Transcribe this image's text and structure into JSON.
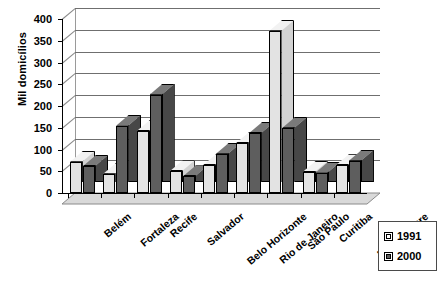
{
  "chart_data": {
    "type": "bar",
    "title": "",
    "xlabel": "",
    "ylabel": "Mil domicílios",
    "ylim": [
      0,
      400
    ],
    "ytick_step": 50,
    "yticks": [
      "400",
      "350",
      "300",
      "250",
      "200",
      "150",
      "100",
      "50",
      "0"
    ],
    "grid": true,
    "legend_position": "bottom-right",
    "style": "3d-clustered-column",
    "categories": [
      "Belém",
      "Fortaleza",
      "Recife",
      "Salvador",
      "Belo Horizonte",
      "Rio de Janeiro",
      "São Paulo",
      "Curitiba",
      "Porto Alegre"
    ],
    "series": [
      {
        "name": "1991",
        "color": "#e3e3e3",
        "values": [
          72,
          44,
          142,
          50,
          64,
          115,
          373,
          48,
          64
        ]
      },
      {
        "name": "2000",
        "color": "#5e5e5e",
        "values": [
          62,
          155,
          226,
          38,
          90,
          138,
          150,
          47,
          74
        ]
      }
    ]
  },
  "legend": {
    "entries": [
      {
        "label": "1991",
        "swatch": "light-square-swatch"
      },
      {
        "label": "2000",
        "swatch": "dark-square-swatch"
      }
    ]
  }
}
